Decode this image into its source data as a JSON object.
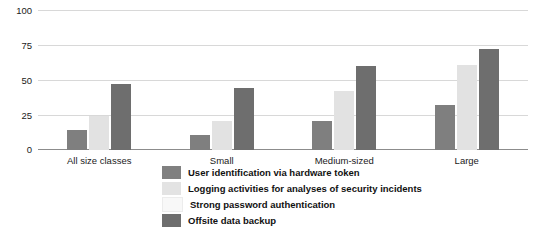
{
  "chart_data": {
    "type": "bar",
    "title": "",
    "xlabel": "",
    "ylabel": "",
    "ylim": [
      0,
      100
    ],
    "yticks": [
      0,
      25,
      50,
      75,
      100
    ],
    "grid": true,
    "legend_position": "bottom-center",
    "categories": [
      "All size classes",
      "Small",
      "Medium-sized",
      "Large"
    ],
    "series": [
      {
        "name": "User identification via hardware token",
        "color": "#7f7f7f",
        "values": [
          14,
          11,
          21,
          32
        ]
      },
      {
        "name": "Logging activities for analyses of security incidents",
        "color": "#e2e2e2",
        "values": [
          24,
          21,
          42,
          61
        ]
      },
      {
        "name": "Strong password authentication",
        "color": "#f7f7f7",
        "values": [
          null,
          null,
          null,
          null
        ]
      },
      {
        "name": "Offsite data backup",
        "color": "#6e6e6e",
        "values": [
          47,
          44,
          60,
          72
        ]
      }
    ]
  },
  "axis": {
    "y_tick_labels": [
      "100",
      "75",
      "50",
      "25",
      "0"
    ]
  },
  "legend": {
    "items": [
      {
        "label": "User identification via hardware token",
        "color": "#808080"
      },
      {
        "label": "Logging activities for analyses of security incidents",
        "color": "#e3e3e3"
      },
      {
        "label": "Strong password authentication",
        "color": "#f8f8f8"
      },
      {
        "label": "Offsite data backup",
        "color": "#6e6e6e"
      }
    ]
  }
}
